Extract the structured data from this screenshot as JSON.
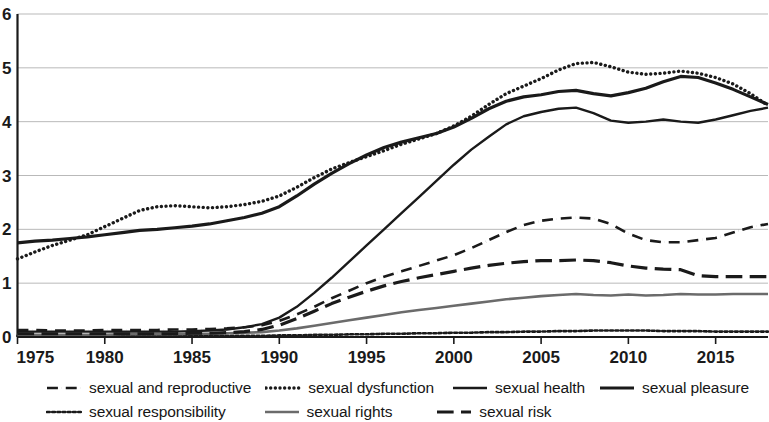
{
  "chart_data": {
    "type": "line",
    "title": "",
    "subtitle": "",
    "xlabel": "",
    "ylabel": "",
    "xlim": [
      1975,
      2018
    ],
    "ylim": [
      0,
      6
    ],
    "grid": true,
    "legend_position": "bottom",
    "x_ticks": [
      "1975",
      "1980",
      "1985",
      "1990",
      "1995",
      "2000",
      "2005",
      "2010",
      "2015"
    ],
    "x_tick_values": [
      1975,
      1980,
      1985,
      1990,
      1995,
      2000,
      2005,
      2010,
      2015
    ],
    "y_ticks": [
      "0",
      "1",
      "2",
      "3",
      "4",
      "5",
      "6"
    ],
    "y_tick_values": [
      0,
      1,
      2,
      3,
      4,
      5,
      6
    ],
    "x": [
      1975,
      1976,
      1977,
      1978,
      1979,
      1980,
      1981,
      1982,
      1983,
      1984,
      1985,
      1986,
      1987,
      1988,
      1989,
      1990,
      1991,
      1992,
      1993,
      1994,
      1995,
      1996,
      1997,
      1998,
      1999,
      2000,
      2001,
      2002,
      2003,
      2004,
      2005,
      2006,
      2007,
      2008,
      2009,
      2010,
      2011,
      2012,
      2013,
      2014,
      2015,
      2016,
      2017,
      2018
    ],
    "series": [
      {
        "name": "sexual and reproductive",
        "style": "dashdot",
        "color": "#1a1a1a",
        "width": 2.6,
        "values": [
          0.13,
          0.13,
          0.12,
          0.12,
          0.12,
          0.13,
          0.13,
          0.13,
          0.13,
          0.14,
          0.14,
          0.15,
          0.16,
          0.18,
          0.22,
          0.3,
          0.42,
          0.56,
          0.72,
          0.86,
          1.0,
          1.12,
          1.22,
          1.32,
          1.42,
          1.52,
          1.65,
          1.8,
          1.95,
          2.08,
          2.16,
          2.2,
          2.22,
          2.2,
          2.1,
          1.92,
          1.8,
          1.76,
          1.76,
          1.8,
          1.84,
          1.94,
          2.04,
          2.1
        ]
      },
      {
        "name": "sexual dysfunction",
        "style": "dotted",
        "color": "#1a1a1a",
        "width": 3.4,
        "values": [
          1.45,
          1.58,
          1.7,
          1.8,
          1.9,
          2.05,
          2.2,
          2.35,
          2.42,
          2.44,
          2.42,
          2.4,
          2.42,
          2.46,
          2.52,
          2.62,
          2.78,
          2.96,
          3.12,
          3.24,
          3.35,
          3.46,
          3.58,
          3.68,
          3.78,
          3.92,
          4.1,
          4.32,
          4.52,
          4.66,
          4.8,
          4.96,
          5.08,
          5.1,
          5.02,
          4.92,
          4.88,
          4.9,
          4.94,
          4.9,
          4.82,
          4.7,
          4.52,
          4.3
        ]
      },
      {
        "name": "sexual health",
        "style": "solid",
        "color": "#1a1a1a",
        "width": 2.4,
        "values": [
          0.1,
          0.1,
          0.1,
          0.1,
          0.1,
          0.1,
          0.1,
          0.1,
          0.1,
          0.1,
          0.11,
          0.12,
          0.14,
          0.18,
          0.24,
          0.36,
          0.56,
          0.82,
          1.1,
          1.4,
          1.7,
          2.0,
          2.3,
          2.6,
          2.9,
          3.2,
          3.48,
          3.72,
          3.95,
          4.1,
          4.18,
          4.24,
          4.26,
          4.16,
          4.02,
          3.98,
          4.0,
          4.04,
          4.0,
          3.98,
          4.04,
          4.12,
          4.2,
          4.26
        ]
      },
      {
        "name": "sexual pleasure",
        "style": "solid-thick",
        "color": "#1a1a1a",
        "width": 3.2,
        "values": [
          1.75,
          1.78,
          1.8,
          1.83,
          1.86,
          1.9,
          1.94,
          1.98,
          2.0,
          2.03,
          2.06,
          2.1,
          2.16,
          2.22,
          2.3,
          2.42,
          2.62,
          2.84,
          3.04,
          3.22,
          3.38,
          3.52,
          3.62,
          3.7,
          3.78,
          3.9,
          4.06,
          4.24,
          4.38,
          4.46,
          4.5,
          4.56,
          4.58,
          4.52,
          4.48,
          4.54,
          4.62,
          4.74,
          4.84,
          4.82,
          4.72,
          4.6,
          4.46,
          4.32
        ]
      },
      {
        "name": "sexual responsibility",
        "style": "fine-dotted",
        "color": "#1a1a1a",
        "width": 2.6,
        "values": [
          0.02,
          0.02,
          0.02,
          0.02,
          0.02,
          0.02,
          0.02,
          0.02,
          0.02,
          0.02,
          0.02,
          0.02,
          0.02,
          0.02,
          0.02,
          0.03,
          0.03,
          0.04,
          0.04,
          0.05,
          0.05,
          0.06,
          0.06,
          0.07,
          0.07,
          0.08,
          0.08,
          0.09,
          0.09,
          0.1,
          0.1,
          0.11,
          0.11,
          0.12,
          0.12,
          0.12,
          0.12,
          0.11,
          0.11,
          0.11,
          0.1,
          0.1,
          0.1,
          0.1
        ]
      },
      {
        "name": "sexual rights",
        "style": "solid-gray",
        "color": "#6b6b6b",
        "width": 2.6,
        "values": [
          0.04,
          0.04,
          0.04,
          0.04,
          0.04,
          0.04,
          0.05,
          0.05,
          0.05,
          0.05,
          0.06,
          0.06,
          0.07,
          0.08,
          0.09,
          0.12,
          0.16,
          0.21,
          0.26,
          0.31,
          0.36,
          0.41,
          0.46,
          0.5,
          0.54,
          0.58,
          0.62,
          0.66,
          0.7,
          0.73,
          0.76,
          0.78,
          0.8,
          0.78,
          0.77,
          0.79,
          0.77,
          0.78,
          0.8,
          0.79,
          0.79,
          0.8,
          0.8,
          0.8
        ]
      },
      {
        "name": "sexual risk",
        "style": "dashed",
        "color": "#1a1a1a",
        "width": 3.2,
        "values": [
          0.06,
          0.06,
          0.06,
          0.06,
          0.06,
          0.06,
          0.06,
          0.06,
          0.06,
          0.06,
          0.07,
          0.07,
          0.08,
          0.1,
          0.14,
          0.22,
          0.34,
          0.48,
          0.62,
          0.74,
          0.85,
          0.95,
          1.03,
          1.1,
          1.16,
          1.22,
          1.28,
          1.33,
          1.37,
          1.4,
          1.42,
          1.42,
          1.43,
          1.42,
          1.38,
          1.32,
          1.28,
          1.26,
          1.25,
          1.14,
          1.12,
          1.12,
          1.12,
          1.12
        ]
      }
    ]
  },
  "legend": {
    "rows": [
      [
        {
          "label": "sexual and reproductive",
          "swatch": "dashdot-swatch"
        },
        {
          "label": "sexual dysfunction",
          "swatch": "dotted-swatch"
        },
        {
          "label": "sexual health",
          "swatch": "solid-swatch"
        },
        {
          "label": "sexual pleasure",
          "swatch": "solid-thick-swatch"
        }
      ],
      [
        {
          "label": "sexual responsibility",
          "swatch": "fine-dotted-swatch"
        },
        {
          "label": "sexual rights",
          "swatch": "solid-gray-swatch"
        },
        {
          "label": "sexual risk",
          "swatch": "dashed-swatch"
        }
      ]
    ]
  },
  "axes": {
    "gridline_color": "#b9b9b9",
    "axis_color": "#1a1a1a"
  }
}
